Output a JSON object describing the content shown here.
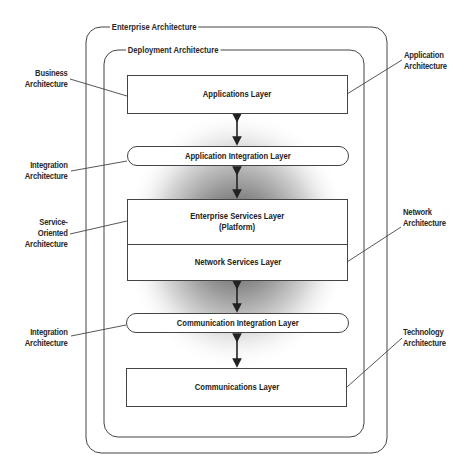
{
  "frames": {
    "outer": "Enterprise Architecture",
    "inner": "Deployment Architecture"
  },
  "layers": {
    "applications": "Applications Layer",
    "application_integration": "Application Integration Layer",
    "enterprise_services_line1": "Enterprise Services Layer",
    "enterprise_services_line2": "(Platform)",
    "network_services": "Network Services Layer",
    "communication_integration": "Communication Integration Layer",
    "communications": "Communications Layer"
  },
  "left_labels": {
    "business": [
      "Business",
      "Architecture"
    ],
    "integration_top": [
      "Integration",
      "Architecture"
    ],
    "soa": [
      "Service-",
      "Oriented",
      "Architecture"
    ],
    "integration_bottom": [
      "Integration",
      "Architecture"
    ]
  },
  "right_labels": {
    "application": [
      "Application",
      "Architecture"
    ],
    "network": [
      "Network",
      "Architecture"
    ],
    "technology": [
      "Technology",
      "Architecture"
    ]
  },
  "colors": {
    "line": "#444444",
    "glow_center": "#555555",
    "background": "#ffffff"
  }
}
